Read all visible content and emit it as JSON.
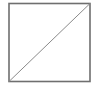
{
  "figure": {
    "square": {
      "x": 9,
      "y": 3.5,
      "width": 81,
      "height": 78,
      "stroke": "#6f6f6f",
      "stroke_width": 1.6
    },
    "diagonal": {
      "x1": 9,
      "y1": 81.5,
      "x2": 90,
      "y2": 3.5,
      "stroke": "#8a8a8a",
      "stroke_width": 1
    },
    "background": "#ffffff"
  }
}
